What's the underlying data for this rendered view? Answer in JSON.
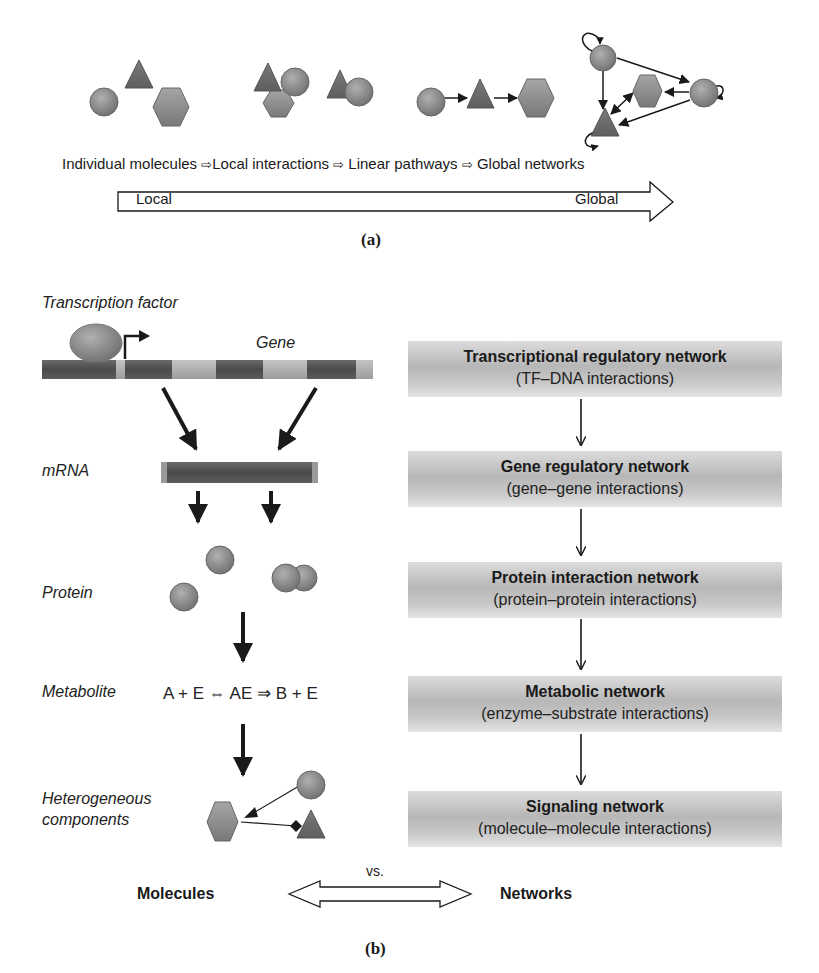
{
  "panel_a": {
    "stages": [
      {
        "label": "Individual molecules"
      },
      {
        "label": "Local interactions"
      },
      {
        "label": "Linear pathways"
      },
      {
        "label": "Global networks"
      }
    ],
    "separator_glyph": "⇨",
    "scale_arrow": {
      "left_label": "Local",
      "right_label": "Global"
    },
    "caption": "(a)"
  },
  "panel_b": {
    "left_column": {
      "transcription_factor_label": "Transcription factor",
      "gene_label": "Gene",
      "levels": [
        {
          "label": "mRNA"
        },
        {
          "label": "Protein"
        },
        {
          "label": "Metabolite"
        },
        {
          "label_line1": "Heterogeneous",
          "label_line2": "components"
        }
      ],
      "metabolite_equation": "A + E ⇔ AE ⇒ B + E"
    },
    "networks": [
      {
        "title": "Transcriptional regulatory network",
        "subtitle": "(TF–DNA interactions)"
      },
      {
        "title": "Gene regulatory network",
        "subtitle": "(gene–gene interactions)"
      },
      {
        "title": "Protein interaction network",
        "subtitle": "(protein–protein interactions)"
      },
      {
        "title": "Metabolic network",
        "subtitle": "(enzyme–substrate interactions)"
      },
      {
        "title": "Signaling network",
        "subtitle": "(molecule–molecule interactions)"
      }
    ],
    "comparison": {
      "left": "Molecules",
      "middle": "vs.",
      "right": "Networks"
    },
    "caption": "(b)"
  },
  "colors": {
    "shape_fill": "#8a8a8a",
    "shape_dark": "#6e6e6e",
    "arrow": "#1a1a1a",
    "box_gradient_mid": "#b7b7b7"
  }
}
